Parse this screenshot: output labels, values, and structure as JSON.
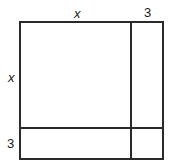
{
  "diagram": {
    "title": "",
    "labels": {
      "top_left": "x",
      "top_right": "3",
      "side_top": "x",
      "side_bottom": "3"
    },
    "regions": [
      {
        "name": "x-by-x square",
        "width": "x",
        "height": "x"
      },
      {
        "name": "3-by-x rectangle",
        "width": "3",
        "height": "x"
      },
      {
        "name": "x-by-3 rectangle",
        "width": "x",
        "height": "3"
      },
      {
        "name": "3-by-3 square",
        "width": "3",
        "height": "3"
      }
    ],
    "colors": {
      "line": "#2a2a2a",
      "background": "#ffffff"
    }
  }
}
